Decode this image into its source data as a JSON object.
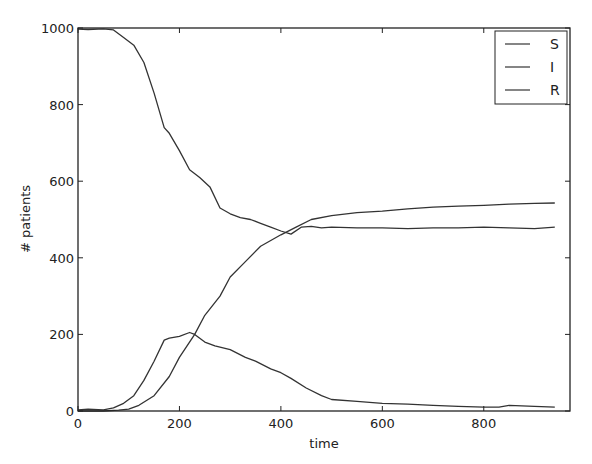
{
  "chart_data": {
    "type": "line",
    "title": "",
    "xlabel": "time",
    "ylabel": "# patients",
    "xlim": [
      0,
      970
    ],
    "ylim": [
      0,
      1000
    ],
    "xticks": [
      0,
      200,
      400,
      600,
      800
    ],
    "yticks": [
      0,
      200,
      400,
      600,
      800,
      1000
    ],
    "grid": false,
    "legend_position": "upper right",
    "legend": [
      "S",
      "I",
      "R"
    ],
    "series": [
      {
        "name": "S",
        "color": "#333333",
        "x": [
          0,
          20,
          50,
          70,
          90,
          110,
          130,
          150,
          170,
          180,
          200,
          220,
          240,
          260,
          280,
          300,
          320,
          340,
          360,
          380,
          400,
          420,
          440,
          460,
          480,
          500,
          550,
          600,
          650,
          700,
          750,
          800,
          850,
          900,
          940
        ],
        "y": [
          997,
          996,
          998,
          995,
          975,
          955,
          910,
          830,
          740,
          725,
          680,
          630,
          610,
          585,
          530,
          515,
          505,
          500,
          490,
          480,
          470,
          462,
          480,
          482,
          478,
          480,
          478,
          478,
          476,
          478,
          478,
          480,
          478,
          476,
          480
        ]
      },
      {
        "name": "I",
        "color": "#333333",
        "x": [
          0,
          20,
          50,
          70,
          90,
          110,
          130,
          150,
          170,
          180,
          200,
          220,
          230,
          250,
          270,
          300,
          330,
          350,
          380,
          400,
          420,
          450,
          480,
          500,
          550,
          600,
          650,
          700,
          750,
          800,
          830,
          850,
          900,
          940
        ],
        "y": [
          3,
          5,
          3,
          8,
          20,
          40,
          80,
          130,
          185,
          190,
          195,
          205,
          200,
          180,
          170,
          160,
          140,
          130,
          110,
          100,
          85,
          60,
          40,
          30,
          25,
          20,
          18,
          15,
          12,
          10,
          10,
          15,
          12,
          10
        ]
      },
      {
        "name": "R",
        "color": "#333333",
        "x": [
          0,
          50,
          80,
          100,
          120,
          150,
          180,
          200,
          230,
          250,
          280,
          300,
          330,
          360,
          400,
          430,
          460,
          500,
          550,
          600,
          650,
          700,
          750,
          800,
          850,
          900,
          940
        ],
        "y": [
          0,
          0,
          2,
          5,
          15,
          40,
          90,
          140,
          200,
          250,
          300,
          350,
          390,
          430,
          460,
          480,
          500,
          510,
          518,
          522,
          528,
          532,
          535,
          537,
          540,
          542,
          543
        ]
      }
    ]
  }
}
